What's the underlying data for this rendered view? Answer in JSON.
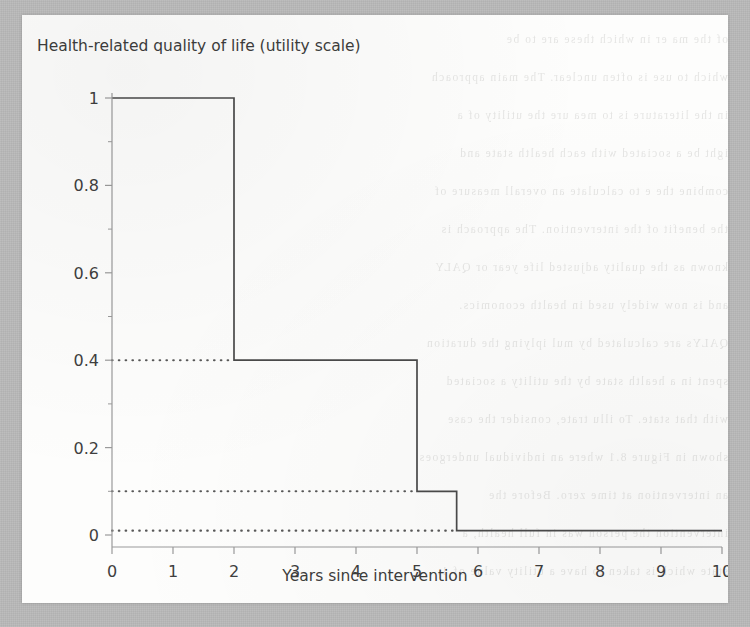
{
  "chart_data": {
    "type": "line",
    "subtype": "step-post",
    "title": "Health-related quality of life (utility scale)",
    "xlabel": "Years since intervention",
    "ylabel": "",
    "xlim": [
      0,
      10
    ],
    "ylim": [
      -0.02,
      1.04
    ],
    "grid": false,
    "legend": null,
    "xticks": [
      "0",
      "1",
      "2",
      "3",
      "4",
      "5",
      "6",
      "7",
      "8",
      "9",
      "10"
    ],
    "xtick_values": [
      0,
      1,
      2,
      3,
      4,
      5,
      6,
      7,
      8,
      9,
      10
    ],
    "yticks": [
      "0",
      "0.2",
      "0.4",
      "0.6",
      "0.8",
      "1"
    ],
    "ytick_values": [
      0,
      0.2,
      0.4,
      0.6,
      0.8,
      1
    ],
    "y_minor_ticks": [
      0.1,
      0.3,
      0.5,
      0.7,
      0.9
    ],
    "series": [
      {
        "name": "Health-related quality of life",
        "style": "solid",
        "color": "#4a4a4a",
        "x": [
          0,
          2,
          2,
          5,
          5,
          5.65,
          5.65,
          10
        ],
        "y": [
          1,
          1,
          0.4,
          0.4,
          0.1,
          0.1,
          0.01,
          0.01
        ],
        "steps": [
          {
            "from_x": 0,
            "to_x": 2,
            "value": 1
          },
          {
            "from_x": 2,
            "to_x": 5,
            "value": 0.4
          },
          {
            "from_x": 5,
            "to_x": 5.65,
            "value": 0.1
          },
          {
            "from_x": 5.65,
            "to_x": 10,
            "value": 0.01
          }
        ]
      }
    ],
    "reference_lines": [
      {
        "name": "reference-line-0.4",
        "axis": "y",
        "value": 0.4,
        "style": "dotted",
        "color": "#585858",
        "x_from": 0,
        "x_to": 2
      },
      {
        "name": "reference-line-0.1",
        "axis": "y",
        "value": 0.1,
        "style": "dotted",
        "color": "#585858",
        "x_from": 0,
        "x_to": 5
      },
      {
        "name": "reference-line-0",
        "axis": "y",
        "value": 0.01,
        "style": "dotted",
        "color": "#585858",
        "x_from": 0,
        "x_to": 5.65
      }
    ]
  },
  "chart": {
    "title": "Health-related quality of life (utility scale)",
    "xlabel": "Years since intervention"
  },
  "colors": {
    "page_background": "#b9b9b9",
    "panel_background": "#fdfdfc",
    "data_line": "#4a4a4a",
    "dotted_line": "#585858",
    "axis": "#9a9a9a",
    "text": "#3d3d3d"
  },
  "bleed_text": {
    "lines": [
      "of the ma er in which these are to be",
      "which to use is often unclear. The main approach",
      "in the literature is to mea ure the utility of a",
      "ight be a sociated with each health state and",
      "combine the e to calculate an overall measure of",
      "the benefit of the intervention. The approach is",
      "known as the quality adjusted life year or QALY",
      "and is now widely used in health economics.",
      "QALYs are calculated by mul iplying the duration",
      "spent in a health state by the utility a sociated",
      "with that state. To illu trate, consider the case",
      "shown in Figure 8.1 where an individual undergoes",
      "an intervention at time zero. Before the",
      "intervention the person was in full health, a",
      "state which is taken to have a utility value of 1."
    ]
  }
}
